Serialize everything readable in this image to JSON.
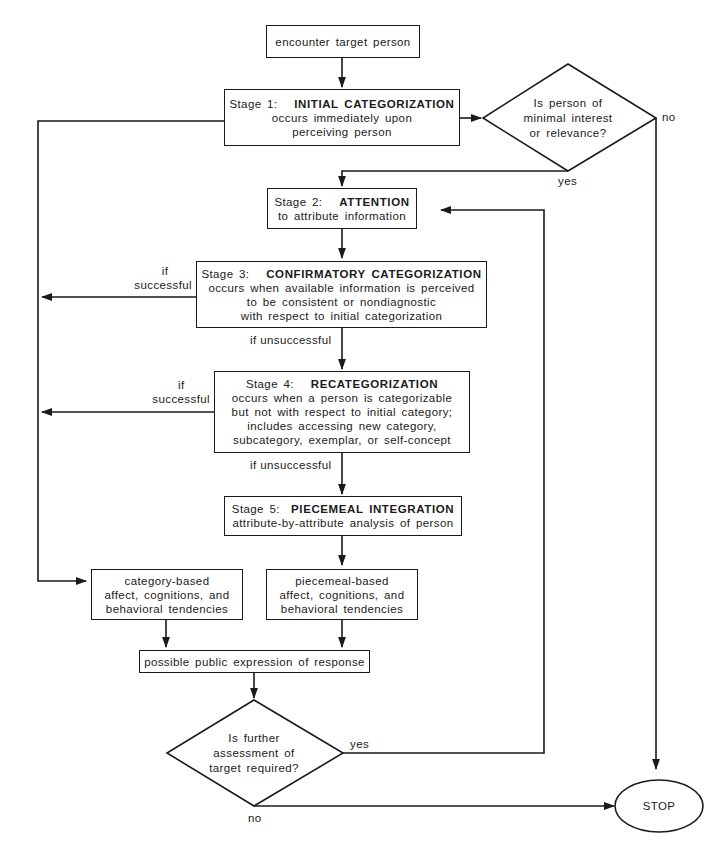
{
  "diagram": {
    "type": "flowchart",
    "nodes": {
      "start": {
        "text": "encounter target person"
      },
      "stage1": {
        "stage": "Stage 1:",
        "name": "INITIAL CATEGORIZATION",
        "lines": [
          "occurs immediately upon",
          "perceiving person"
        ]
      },
      "decision1": {
        "lines": [
          "Is person of",
          "minimal interest",
          "or relevance?"
        ],
        "yes_label": "yes",
        "no_label": "no"
      },
      "stage2": {
        "stage": "Stage 2:",
        "name": "ATTENTION",
        "lines": [
          "to attribute information"
        ]
      },
      "stage3": {
        "stage": "Stage 3:",
        "name": "CONFIRMATORY CATEGORIZATION",
        "lines": [
          "occurs when available information is perceived",
          "to be consistent or nondiagnostic",
          "with respect to initial categorization"
        ],
        "success_label": [
          "if",
          "successful"
        ],
        "fail_label": "if unsuccessful"
      },
      "stage4": {
        "stage": "Stage 4:",
        "name": "RECATEGORIZATION",
        "lines": [
          "occurs when a person is categorizable",
          "but not with respect to initial category;",
          "includes accessing new category,",
          "subcategory, exemplar, or self-concept"
        ],
        "success_label": [
          "if",
          "successful"
        ],
        "fail_label": "if unsuccessful"
      },
      "stage5": {
        "stage": "Stage 5:",
        "name": "PIECEMEAL INTEGRATION",
        "lines": [
          "attribute-by-attribute analysis of person"
        ]
      },
      "category_based": {
        "lines": [
          "category-based",
          "affect, cognitions, and",
          "behavioral tendencies"
        ]
      },
      "piecemeal_based": {
        "lines": [
          "piecemeal-based",
          "affect, cognitions, and",
          "behavioral tendencies"
        ]
      },
      "response": {
        "text": "possible public expression of response"
      },
      "decision2": {
        "lines": [
          "Is further",
          "assessment of",
          "target required?"
        ],
        "yes_label": "yes",
        "no_label": "no"
      },
      "stop": {
        "text": "STOP"
      }
    }
  }
}
